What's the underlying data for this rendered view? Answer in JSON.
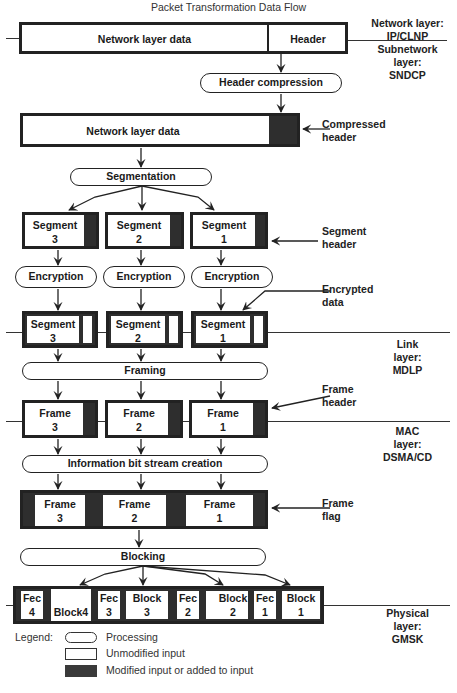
{
  "title": "Packet Transformation Data Flow",
  "layers": {
    "network": "Network layer:\nIP/CLNP",
    "network_l1": "Network layer:",
    "network_l2": "IP/CLNP",
    "subnetwork_l1": "Subnetwork",
    "subnetwork_l2": "layer:",
    "subnetwork_l3": "SNDCP",
    "link_l1": "Link",
    "link_l2": "layer:",
    "link_l3": "MDLP",
    "mac_l1": "MAC",
    "mac_l2": "layer:",
    "mac_l3": "DSMA/CD",
    "phys_l1": "Physical",
    "phys_l2": "layer:",
    "phys_l3": "GMSK"
  },
  "network_packet": {
    "data": "Network layer data",
    "header": "Header"
  },
  "processes": {
    "header_compression": "Header compression",
    "segmentation": "Segmentation",
    "encryption": "Encryption",
    "framing": "Framing",
    "bitstream": "Information bit stream creation",
    "blocking": "Blocking"
  },
  "compressed_packet": {
    "data": "Network layer data"
  },
  "annotations": {
    "compressed_header_l1": "Compressed",
    "compressed_header_l2": "header",
    "segment_header_l1": "Segment",
    "segment_header_l2": "header",
    "encrypted_data_l1": "Encrypted",
    "encrypted_data_l2": "data",
    "frame_header_l1": "Frame",
    "frame_header_l2": "header",
    "frame_flag_l1": "Frame",
    "frame_flag_l2": "flag"
  },
  "segments": [
    {
      "name": "Segment",
      "num": "3"
    },
    {
      "name": "Segment",
      "num": "2"
    },
    {
      "name": "Segment",
      "num": "1"
    }
  ],
  "frames": [
    {
      "name": "Frame",
      "num": "3"
    },
    {
      "name": "Frame",
      "num": "2"
    },
    {
      "name": "Frame",
      "num": "1"
    }
  ],
  "blocks": {
    "fec4_a": "Fec",
    "fec4_b": "4",
    "block4": "Block4",
    "fec3_a": "Fec",
    "fec3_b": "3",
    "block3_a": "Block",
    "block3_b": "3",
    "fec2_a": "Fec",
    "fec2_b": "2",
    "block2_a": "Block",
    "block2_b": "2",
    "fec1_a": "Fec",
    "fec1_b": "1",
    "block1_a": "Block",
    "block1_b": "1"
  },
  "legend": {
    "label": "Legend:",
    "processing": "Processing",
    "unmodified": "Unmodified input",
    "modified": "Modified input or added to input"
  },
  "colors": {
    "dark": "#2e2e2e",
    "line": "#222222"
  }
}
